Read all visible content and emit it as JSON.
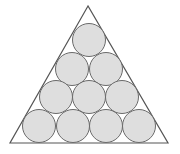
{
  "diagram": {
    "colors": {
      "background": "#ffffff",
      "triangle_stroke": "#555555",
      "circle_fill": "#dedede",
      "circle_stroke": "#6a6a6a"
    },
    "triangle": {
      "apex": [
        88,
        6
      ],
      "bottom_left": [
        10,
        143
      ],
      "bottom_right": [
        168,
        143
      ]
    },
    "circle_radius": 16.5,
    "rows": [
      {
        "row": 1,
        "centers": [
          [
            89,
            40
          ]
        ]
      },
      {
        "row": 2,
        "centers": [
          [
            72,
            69
          ],
          [
            106,
            69
          ]
        ]
      },
      {
        "row": 3,
        "centers": [
          [
            56,
            97
          ],
          [
            89,
            97
          ],
          [
            122,
            97
          ]
        ]
      },
      {
        "row": 4,
        "centers": [
          [
            39,
            126
          ],
          [
            73,
            126
          ],
          [
            106,
            126
          ],
          [
            139,
            126
          ]
        ]
      }
    ],
    "circle_count": 10
  }
}
